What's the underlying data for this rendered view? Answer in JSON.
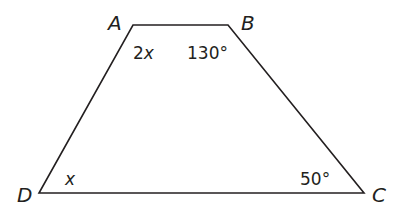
{
  "diagram": {
    "type": "trapezoid",
    "stroke_color": "#231f20",
    "vertices": [
      {
        "name": "A",
        "label": "A",
        "x": 133,
        "y": 25
      },
      {
        "name": "B",
        "label": "B",
        "x": 228,
        "y": 25
      },
      {
        "name": "C",
        "label": "C",
        "x": 364,
        "y": 193
      },
      {
        "name": "D",
        "label": "D",
        "x": 39,
        "y": 193
      }
    ],
    "angles": {
      "A": {
        "coef": "2",
        "var": "x"
      },
      "B": "130°",
      "C": "50°",
      "D": {
        "var": "x"
      }
    }
  }
}
